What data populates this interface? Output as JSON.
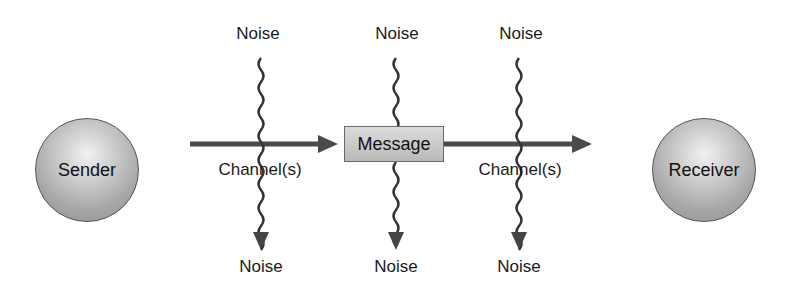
{
  "diagram": {
    "sender": {
      "label": "Sender"
    },
    "receiver": {
      "label": "Receiver"
    },
    "message": {
      "label": "Message"
    },
    "channels": [
      {
        "label": "Channel(s)"
      },
      {
        "label": "Channel(s)"
      }
    ],
    "noise_top": [
      {
        "label": "Noise"
      },
      {
        "label": "Noise"
      },
      {
        "label": "Noise"
      }
    ],
    "noise_bottom": [
      {
        "label": "Noise"
      },
      {
        "label": "Noise"
      },
      {
        "label": "Noise"
      }
    ],
    "colors": {
      "arrow": "#4a4a4a",
      "node_fill": "#b0b0b0",
      "message_fill": "#c8c8c8"
    }
  }
}
